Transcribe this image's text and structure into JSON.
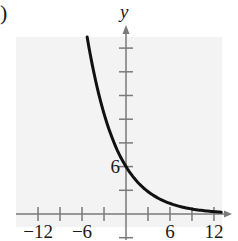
{
  "panel_label": ")",
  "colors": {
    "background": "#ffffff",
    "plot_area": "#f3f3f3",
    "axis": "#7a7a7a",
    "curve": "#111111",
    "text": "#1a1a1a"
  },
  "chart_data": {
    "type": "line",
    "title": "",
    "xlabel": "",
    "ylabel": "y",
    "xlim": [
      -15,
      13
    ],
    "ylim": [
      -3,
      23
    ],
    "x_tick_step": 3,
    "y_tick_step": 3,
    "x_tick_labels": [
      {
        "value": -12,
        "label": "−12"
      },
      {
        "value": -6,
        "label": "−6"
      },
      {
        "value": 6,
        "label": "6"
      },
      {
        "value": 12,
        "label": "12"
      }
    ],
    "y_tick_labels": [
      {
        "value": 6,
        "label": "6"
      }
    ],
    "grid": false,
    "legend": null,
    "series": [
      {
        "name": "y = 6e^(-x/4)",
        "x": [
          -5.3,
          -4,
          -3,
          -2,
          -1,
          0,
          1,
          2,
          3,
          4,
          6,
          8,
          10,
          12,
          13
        ],
        "y": [
          22.4,
          16.3,
          12.7,
          9.9,
          7.7,
          6.0,
          4.67,
          3.64,
          2.83,
          2.21,
          1.34,
          0.81,
          0.49,
          0.3,
          0.23
        ]
      }
    ]
  }
}
